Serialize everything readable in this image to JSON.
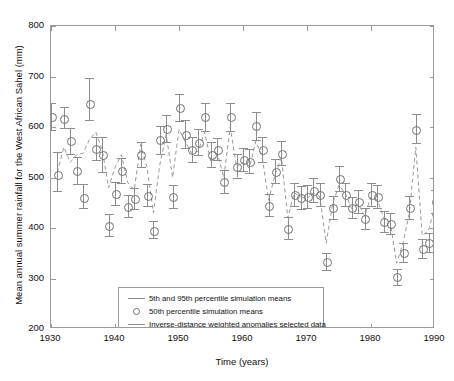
{
  "chart_data": {
    "type": "line",
    "title": "",
    "xlabel": "Time (years)",
    "ylabel": "Mean annual summer rainfall for the West African Sahel (mm)",
    "xlim": [
      1930,
      1990
    ],
    "ylim": [
      200,
      800
    ],
    "xticks": [
      1930,
      1940,
      1950,
      1960,
      1970,
      1980,
      1990
    ],
    "yticks": [
      200,
      300,
      400,
      500,
      600,
      700,
      800
    ],
    "grid": false,
    "legend_position": "lower-left",
    "legend": [
      "5th and 95th percentile simulation means",
      "50th percentile simulation means",
      "Inverse-distance weighted anomalies selected data"
    ],
    "x": [
      1930,
      1931,
      1932,
      1933,
      1934,
      1935,
      1936,
      1937,
      1938,
      1939,
      1940,
      1941,
      1942,
      1943,
      1944,
      1945,
      1946,
      1947,
      1948,
      1949,
      1950,
      1951,
      1952,
      1953,
      1954,
      1955,
      1956,
      1957,
      1958,
      1959,
      1960,
      1961,
      1962,
      1963,
      1964,
      1965,
      1966,
      1967,
      1968,
      1969,
      1970,
      1971,
      1972,
      1973,
      1974,
      1975,
      1976,
      1977,
      1978,
      1979,
      1980,
      1981,
      1982,
      1983,
      1984,
      1985,
      1986,
      1987,
      1988,
      1989,
      1990
    ],
    "series": [
      {
        "name": "50th percentile simulation means",
        "style": "circles",
        "values": [
          620,
          505,
          616,
          573,
          513,
          461,
          646,
          557,
          545,
          405,
          468,
          513,
          443,
          458,
          545,
          465,
          395,
          575,
          597,
          462,
          638,
          586,
          555,
          570,
          620,
          545,
          556,
          492,
          620,
          522,
          535,
          532,
          602,
          555,
          445,
          512,
          548,
          400,
          466,
          460,
          462,
          475,
          466,
          333,
          440,
          498,
          466,
          440,
          452,
          419,
          466,
          462,
          413,
          408,
          303,
          352,
          440,
          596,
          360,
          371,
          452
        ]
      },
      {
        "name": "5th percentile simulation means",
        "style": "error-bar-lower",
        "values": [
          595,
          474,
          598,
          547,
          487,
          439,
          613,
          535,
          511,
          385,
          446,
          489,
          422,
          437,
          520,
          443,
          380,
          547,
          571,
          440,
          612,
          559,
          531,
          545,
          592,
          521,
          534,
          470,
          593,
          500,
          512,
          509,
          575,
          531,
          424,
          489,
          524,
          379,
          443,
          437,
          440,
          451,
          443,
          316,
          418,
          474,
          443,
          419,
          430,
          399,
          443,
          440,
          393,
          388,
          288,
          333,
          418,
          568,
          341,
          352,
          430
        ]
      },
      {
        "name": "95th percentile simulation means",
        "style": "error-bar-upper",
        "values": [
          648,
          550,
          640,
          598,
          540,
          487,
          697,
          580,
          580,
          427,
          492,
          538,
          466,
          480,
          570,
          488,
          413,
          602,
          624,
          486,
          665,
          613,
          580,
          596,
          648,
          570,
          579,
          515,
          648,
          546,
          559,
          556,
          630,
          580,
          467,
          536,
          573,
          422,
          490,
          484,
          486,
          500,
          490,
          351,
          463,
          523,
          490,
          462,
          475,
          440,
          490,
          486,
          434,
          429,
          319,
          371,
          463,
          625,
          379,
          391,
          475
        ]
      },
      {
        "name": "Inverse-distance weighted anomalies selected data",
        "style": "dashed-line",
        "values": [
          null,
          510,
          560,
          530,
          545,
          548,
          575,
          590,
          555,
          480,
          520,
          545,
          490,
          475,
          565,
          520,
          430,
          525,
          585,
          500,
          595,
          570,
          548,
          552,
          590,
          530,
          548,
          500,
          600,
          520,
          530,
          518,
          572,
          540,
          455,
          505,
          540,
          420,
          470,
          462,
          458,
          470,
          462,
          370,
          448,
          485,
          468,
          438,
          448,
          424,
          462,
          455,
          420,
          412,
          330,
          370,
          430,
          560,
          385,
          395,
          445
        ]
      }
    ]
  },
  "axes": {
    "x_tick_labels": [
      "1930",
      "1940",
      "1950",
      "1960",
      "1970",
      "1980",
      "1990"
    ],
    "y_tick_labels": [
      "200",
      "300",
      "400",
      "500",
      "600",
      "700",
      "800"
    ],
    "x_axis_title": "Time (years)",
    "y_axis_title": "Mean annual summer rainfall for the West African Sahel (mm)"
  },
  "legend": {
    "entries": [
      {
        "key": "line",
        "label": "5th and 95th percentile simulation means"
      },
      {
        "key": "circle",
        "label": "50th percentile simulation means"
      },
      {
        "key": "dashed",
        "label": "Inverse-distance weighted anomalies selected data"
      }
    ]
  },
  "colors": {
    "axis": "#9a9a9a",
    "marker": "#707070",
    "error_bar": "#8d8d8d",
    "anomaly_line": "#8d8d8d",
    "background": "#ffffff",
    "text": "#111111"
  }
}
